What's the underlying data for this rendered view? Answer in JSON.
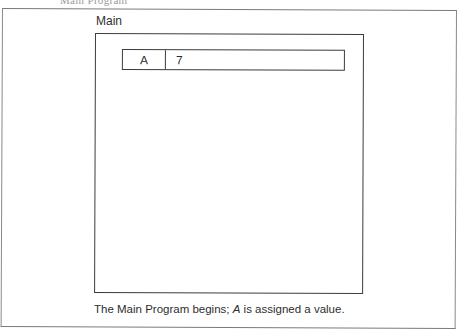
{
  "page": {
    "header_fragment": "Main Program"
  },
  "diagram": {
    "scope_label": "Main",
    "variables": [
      {
        "name": "A",
        "value": "7"
      }
    ]
  },
  "caption": {
    "prefix": "The Main Program begins; ",
    "variable": "A",
    "suffix": " is assigned a value."
  },
  "colors": {
    "line": "#3c3c3c",
    "frame": "#7a7a7a",
    "text": "#2a2a2a",
    "background": "#ffffff"
  }
}
